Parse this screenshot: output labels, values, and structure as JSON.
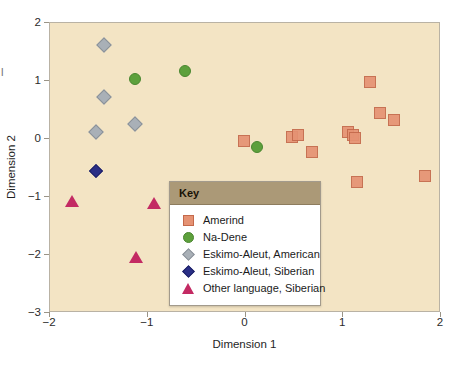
{
  "chart_data": {
    "type": "scatter",
    "title": "",
    "xlabel": "Dimension 1",
    "ylabel": "Dimension 2",
    "xlim": [
      -2,
      2
    ],
    "ylim": [
      -3,
      2
    ],
    "xticks": [
      -2,
      -1,
      0,
      1,
      2
    ],
    "yticks": [
      2,
      1,
      0,
      -1,
      -2,
      -3
    ],
    "xticklabels": [
      "−2",
      "−1",
      "0",
      "1",
      "2"
    ],
    "yticklabels": [
      "2",
      "1",
      "0",
      "−1",
      "−2",
      "−3"
    ],
    "grid": false,
    "legend_position": "inside-bottom-center",
    "plot_background": "#f3e4c4",
    "series": [
      {
        "name": "Amerind",
        "marker": "square",
        "color": "#e59273",
        "points": [
          [
            -0.01,
            -0.06
          ],
          [
            0.49,
            0.01
          ],
          [
            0.55,
            0.06
          ],
          [
            0.69,
            -0.24
          ],
          [
            1.06,
            0.1
          ],
          [
            1.11,
            0.05
          ],
          [
            1.13,
            0.0
          ],
          [
            1.15,
            -0.76
          ],
          [
            1.28,
            0.97
          ],
          [
            1.39,
            0.43
          ],
          [
            1.53,
            0.31
          ],
          [
            1.85,
            -0.66
          ]
        ]
      },
      {
        "name": "Na-Dene",
        "marker": "circle",
        "color": "#5da03c",
        "points": [
          [
            -1.12,
            1.02
          ],
          [
            -0.61,
            1.15
          ],
          [
            0.13,
            -0.16
          ]
        ]
      },
      {
        "name": "Eskimo-Aleut, American",
        "marker": "diamond",
        "color": "#a9b0b7",
        "points": [
          [
            -1.44,
            1.61
          ],
          [
            -1.44,
            0.7
          ],
          [
            -1.12,
            0.24
          ],
          [
            -1.52,
            0.11
          ]
        ]
      },
      {
        "name": "Eskimo-Aleut, Siberian",
        "marker": "diamond",
        "color": "#2a2f86",
        "points": [
          [
            -1.52,
            -0.57
          ]
        ]
      },
      {
        "name": "Other language, Siberian",
        "marker": "triangle",
        "color": "#c32a63",
        "points": [
          [
            -1.76,
            -1.08
          ],
          [
            -0.93,
            -1.12
          ],
          [
            -1.11,
            -2.06
          ]
        ]
      }
    ]
  },
  "legend": {
    "header": "Key",
    "entries": [
      {
        "label": "Amerind",
        "marker": "square",
        "color": "#e59273"
      },
      {
        "label": "Na-Dene",
        "marker": "circle",
        "color": "#5da03c"
      },
      {
        "label": "Eskimo-Aleut, American",
        "marker": "diamond",
        "color": "#a9b0b7"
      },
      {
        "label": "Eskimo-Aleut, Siberian",
        "marker": "diamond-dark",
        "color": "#2a2f86"
      },
      {
        "label": "Other language, Siberian",
        "marker": "triangle",
        "color": "#c32a63"
      }
    ]
  },
  "edge_fragment": "l"
}
